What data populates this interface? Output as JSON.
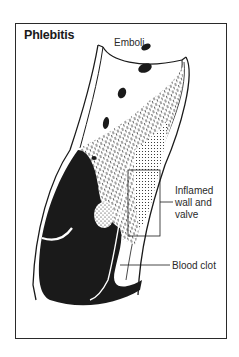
{
  "figure": {
    "title": "Phlebitis",
    "labels": {
      "emboli": "Emboli",
      "inflamed": "Inflamed wall and valve",
      "clot": "Blood clot"
    },
    "colors": {
      "ink": "#1a1a1a",
      "paper": "#ffffff"
    }
  }
}
